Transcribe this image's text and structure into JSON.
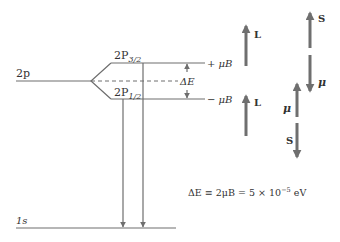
{
  "diagram": {
    "type": "energy-level-diagram",
    "levels": {
      "two_p": {
        "label": "2p"
      },
      "upper": {
        "label_main": "2P",
        "label_sub": "3/2",
        "energy_label": "+ μB"
      },
      "lower": {
        "label_main": "2P",
        "label_sub": "1/2",
        "energy_label": "− μB"
      },
      "ground": {
        "label": "1s"
      }
    },
    "splitting_label": "ΔE",
    "vectors": {
      "upper_state": {
        "orbital": "L",
        "spin": "S",
        "moment": "μ"
      },
      "lower_state": {
        "orbital": "L",
        "moment": "μ",
        "spin": "S"
      }
    },
    "equation": {
      "lhs": "ΔE ≡ 2μB = 5 × 10",
      "exponent": "−5",
      "unit": " eV"
    },
    "colors": {
      "line": "#6e6e6e",
      "vector": "#6f6f6f",
      "text": "#333333"
    }
  }
}
